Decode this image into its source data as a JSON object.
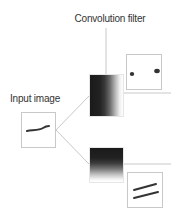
{
  "diagram": {
    "labels": {
      "convolution_filter": "Convolution filter",
      "input_image": "Input image"
    },
    "nodes": [
      {
        "id": "input-image",
        "content": "curved-stroke"
      },
      {
        "id": "filter-top",
        "pattern": "horizontal-gradient-dark-left"
      },
      {
        "id": "filter-bottom",
        "pattern": "vertical-gradient-dark-top"
      },
      {
        "id": "output-top",
        "content": "two-dots"
      },
      {
        "id": "output-bottom",
        "content": "two-parallel-lines"
      }
    ],
    "colors": {
      "line": "#c8c8c8",
      "stroke": "#333333",
      "text": "#333333"
    }
  }
}
